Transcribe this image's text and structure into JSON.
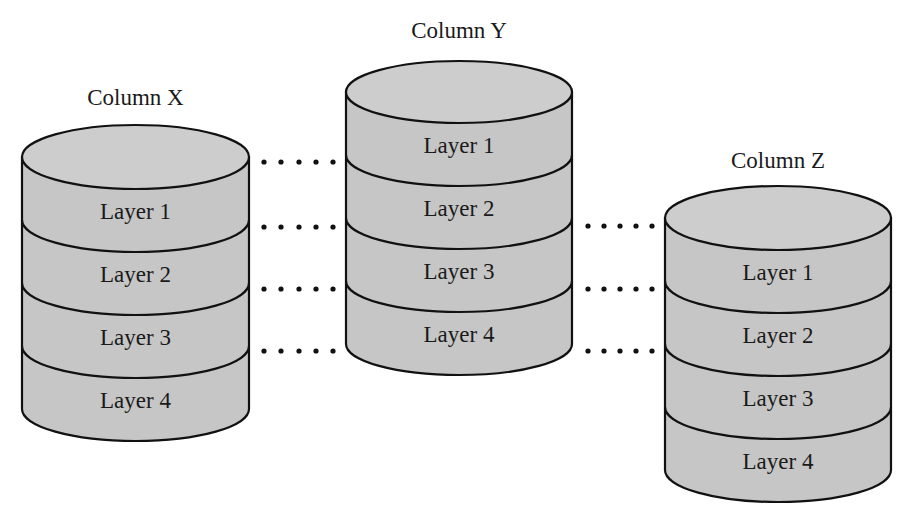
{
  "diagram": {
    "columns": [
      {
        "id": "x",
        "title": "Column X",
        "layers": [
          "Layer 1",
          "Layer 2",
          "Layer 3",
          "Layer 4"
        ],
        "geometry": {
          "left": 22,
          "right": 249,
          "top_center_y": 157,
          "ry": 32,
          "layer_height": 63,
          "title_y": 105
        }
      },
      {
        "id": "y",
        "title": "Column Y",
        "layers": [
          "Layer 1",
          "Layer 2",
          "Layer 3",
          "Layer 4"
        ],
        "geometry": {
          "left": 346,
          "right": 572,
          "top_center_y": 92,
          "ry": 31,
          "layer_height": 63,
          "title_y": 38
        }
      },
      {
        "id": "z",
        "title": "Column Z",
        "layers": [
          "Layer 1",
          "Layer 2",
          "Layer 3",
          "Layer 4"
        ],
        "geometry": {
          "left": 665,
          "right": 891,
          "top_center_y": 218,
          "ry": 32,
          "layer_height": 63,
          "title_y": 168
        }
      }
    ],
    "connectors": [
      {
        "from": "Column X",
        "to": "Column Y",
        "dots_x": [
          264,
          281,
          299,
          316,
          333
        ],
        "rows_y": [
          162,
          227,
          289,
          351
        ]
      },
      {
        "from": "Column Y",
        "to": "Column Z",
        "dots_x": [
          588,
          604,
          620,
          636,
          652
        ],
        "rows_y": [
          226,
          289,
          351
        ]
      }
    ],
    "colors": {
      "fill": "#c6c6c6",
      "top_fill": "#cdcdcd",
      "stroke": "#111111",
      "text": "#1a1a1a",
      "background": "#ffffff"
    }
  }
}
